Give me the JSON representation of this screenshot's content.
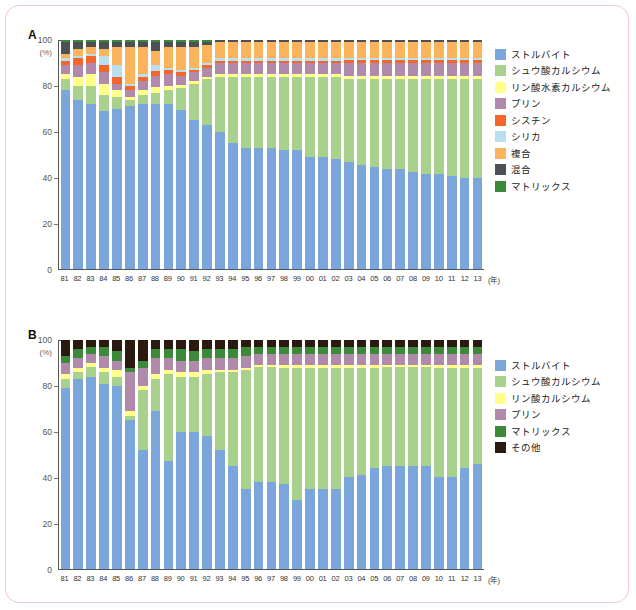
{
  "figure": {
    "border_color": "#f2c9ce",
    "background": "#ffffff"
  },
  "panels": [
    {
      "letter": "A",
      "axis": {
        "unit": "(%)",
        "yticks": [
          "100",
          "80",
          "60",
          "40",
          "20",
          "0"
        ],
        "ylim": [
          0,
          100
        ],
        "xunit": "(年)"
      }
    },
    {
      "letter": "B",
      "axis": {
        "unit": "(%)",
        "yticks": [
          "100",
          "80",
          "60",
          "40",
          "20",
          "0"
        ],
        "ylim": [
          0,
          100
        ],
        "xunit": "(年)"
      }
    }
  ],
  "chart_data": [
    {
      "panel": "A",
      "type": "bar",
      "stacked": true,
      "normalized_percent": true,
      "title": "",
      "xlabel": "(年)",
      "ylabel": "(%)",
      "ylim": [
        0,
        100
      ],
      "yticks": [
        0,
        20,
        40,
        60,
        80,
        100
      ],
      "grid": false,
      "legend_position": "right",
      "categories": [
        "81",
        "82",
        "83",
        "84",
        "85",
        "86",
        "87",
        "88",
        "89",
        "90",
        "91",
        "92",
        "93",
        "94",
        "95",
        "96",
        "97",
        "98",
        "99",
        "00",
        "01",
        "02",
        "03",
        "04",
        "05",
        "06",
        "07",
        "08",
        "09",
        "10",
        "11",
        "12",
        "13"
      ],
      "series": [
        {
          "name": "ストルバイト",
          "color": "#7aa6dc",
          "values": [
            78,
            74,
            72,
            69,
            70,
            71,
            72,
            74,
            72,
            70,
            65,
            63,
            60,
            55,
            53,
            53,
            53,
            52,
            52,
            49,
            49,
            48,
            47,
            46,
            45,
            44,
            44,
            43,
            42,
            42,
            41,
            40,
            40
          ]
        },
        {
          "name": "シュウ酸カルシウム",
          "color": "#a8d18d",
          "values": [
            5,
            6,
            8,
            7,
            5,
            3,
            4,
            5,
            6,
            10,
            16,
            20,
            24,
            29,
            31,
            31,
            31,
            32,
            32,
            35,
            35,
            36,
            37,
            38,
            39,
            40,
            40,
            41,
            42,
            42,
            43,
            44,
            44
          ]
        },
        {
          "name": "リン酸水素カルシウム",
          "color": "#ffff8a",
          "values": [
            2,
            4,
            5,
            5,
            3,
            1,
            2,
            3,
            2,
            1,
            1,
            1,
            1,
            1,
            1,
            1,
            1,
            1,
            1,
            1,
            1,
            1,
            1,
            1,
            1,
            1,
            1,
            1,
            1,
            1,
            1,
            1,
            1
          ]
        },
        {
          "name": "プリン",
          "color": "#b089ab",
          "values": [
            4,
            5,
            5,
            5,
            3,
            3,
            4,
            5,
            5,
            4,
            4,
            4,
            5,
            5,
            5,
            5,
            5,
            5,
            5,
            5,
            5,
            5,
            6,
            6,
            6,
            6,
            6,
            6,
            6,
            6,
            6,
            6,
            6
          ]
        },
        {
          "name": "シスチン",
          "color": "#f4662a",
          "values": [
            2,
            3,
            3,
            3,
            3,
            2,
            2,
            2,
            2,
            2,
            1,
            1,
            1,
            1,
            1,
            1,
            1,
            1,
            1,
            1,
            1,
            1,
            1,
            1,
            1,
            1,
            1,
            1,
            1,
            1,
            1,
            1,
            1
          ]
        },
        {
          "name": "シリカ",
          "color": "#b8dff0",
          "values": [
            1,
            1,
            1,
            4,
            5,
            1,
            1,
            3,
            1,
            1,
            1,
            1,
            1,
            1,
            1,
            1,
            1,
            1,
            1,
            1,
            1,
            1,
            1,
            1,
            1,
            1,
            1,
            1,
            1,
            1,
            1,
            1,
            1
          ]
        },
        {
          "name": "複合",
          "color": "#fbb45c",
          "values": [
            2,
            3,
            3,
            3,
            8,
            16,
            12,
            6,
            9,
            10,
            9,
            8,
            7,
            7,
            7,
            7,
            7,
            7,
            7,
            7,
            7,
            7,
            7,
            7,
            7,
            7,
            7,
            7,
            7,
            7,
            7,
            7,
            7
          ]
        },
        {
          "name": "混合",
          "color": "#4d5156",
          "values": [
            5,
            3,
            2,
            3,
            2,
            2,
            2,
            4,
            2,
            2,
            2,
            1,
            1,
            1,
            1,
            1,
            1,
            1,
            1,
            1,
            1,
            1,
            1,
            1,
            1,
            1,
            1,
            1,
            1,
            1,
            1,
            1,
            1
          ]
        },
        {
          "name": "マトリックス",
          "color": "#3a8a3a",
          "values": [
            1,
            1,
            1,
            1,
            1,
            1,
            1,
            1,
            1,
            1,
            1,
            1,
            0,
            0,
            0,
            0,
            0,
            0,
            0,
            0,
            0,
            0,
            0,
            0,
            0,
            0,
            0,
            0,
            0,
            0,
            0,
            0,
            0
          ]
        }
      ]
    },
    {
      "panel": "B",
      "type": "bar",
      "stacked": true,
      "normalized_percent": true,
      "title": "",
      "xlabel": "(年)",
      "ylabel": "(%)",
      "ylim": [
        0,
        100
      ],
      "yticks": [
        0,
        20,
        40,
        60,
        80,
        100
      ],
      "grid": false,
      "legend_position": "right",
      "categories": [
        "81",
        "82",
        "83",
        "84",
        "85",
        "86",
        "87",
        "88",
        "89",
        "90",
        "91",
        "92",
        "93",
        "94",
        "95",
        "96",
        "97",
        "98",
        "99",
        "00",
        "01",
        "02",
        "03",
        "04",
        "05",
        "06",
        "07",
        "08",
        "09",
        "10",
        "11",
        "12",
        "13"
      ],
      "series": [
        {
          "name": "ストルバイト",
          "color": "#7aa6dc",
          "values": [
            79,
            83,
            84,
            81,
            80,
            65,
            52,
            69,
            47,
            60,
            60,
            58,
            52,
            45,
            35,
            38,
            38,
            37,
            30,
            35,
            35,
            35,
            40,
            41,
            44,
            45,
            45,
            45,
            45,
            40,
            40,
            44,
            46
          ]
        },
        {
          "name": "シュウ酸カルシウム",
          "color": "#a8d18d",
          "values": [
            4,
            3,
            4,
            5,
            4,
            2,
            26,
            14,
            38,
            24,
            24,
            27,
            34,
            41,
            52,
            50,
            50,
            51,
            58,
            53,
            53,
            53,
            48,
            47,
            44,
            43,
            43,
            43,
            43,
            48,
            48,
            44,
            42
          ]
        },
        {
          "name": "リン酸カルシウム",
          "color": "#ffff8a",
          "values": [
            2,
            2,
            2,
            2,
            3,
            2,
            2,
            2,
            2,
            2,
            2,
            2,
            1,
            1,
            1,
            1,
            1,
            1,
            1,
            1,
            1,
            1,
            1,
            1,
            1,
            1,
            1,
            1,
            1,
            1,
            1,
            1,
            1
          ]
        },
        {
          "name": "プリン",
          "color": "#b089ab",
          "values": [
            5,
            4,
            4,
            5,
            4,
            17,
            8,
            7,
            5,
            5,
            5,
            5,
            5,
            5,
            5,
            5,
            5,
            5,
            5,
            5,
            5,
            5,
            5,
            5,
            5,
            5,
            5,
            5,
            5,
            5,
            5,
            5,
            5
          ]
        },
        {
          "name": "マトリックス",
          "color": "#3a8a3a",
          "values": [
            3,
            4,
            3,
            4,
            4,
            2,
            3,
            4,
            4,
            5,
            4,
            4,
            4,
            4,
            4,
            3,
            3,
            3,
            3,
            3,
            3,
            3,
            3,
            3,
            3,
            3,
            3,
            3,
            3,
            3,
            3,
            3,
            3
          ]
        },
        {
          "name": "その他",
          "color": "#2b1a10",
          "values": [
            7,
            4,
            3,
            3,
            5,
            12,
            9,
            4,
            4,
            4,
            5,
            4,
            4,
            4,
            3,
            3,
            3,
            3,
            3,
            3,
            3,
            3,
            3,
            3,
            3,
            3,
            3,
            3,
            3,
            3,
            3,
            3,
            3
          ]
        }
      ]
    }
  ],
  "legends": [
    {
      "panel": "A",
      "items": [
        {
          "label": "ストルバイト",
          "color": "#7aa6dc"
        },
        {
          "label": "シュウ酸カルシウム",
          "color": "#a8d18d"
        },
        {
          "label": "リン酸水素カルシウム",
          "color": "#ffff8a"
        },
        {
          "label": "プリン",
          "color": "#b089ab"
        },
        {
          "label": "シスチン",
          "color": "#f4662a"
        },
        {
          "label": "シリカ",
          "color": "#b8dff0"
        },
        {
          "label": "複合",
          "color": "#fbb45c"
        },
        {
          "label": "混合",
          "color": "#4d5156"
        },
        {
          "label": "マトリックス",
          "color": "#3a8a3a"
        }
      ]
    },
    {
      "panel": "B",
      "items": [
        {
          "label": "ストルバイト",
          "color": "#7aa6dc"
        },
        {
          "label": "シュウ酸カルシウム",
          "color": "#a8d18d"
        },
        {
          "label": "リン酸カルシウム",
          "color": "#ffff8a"
        },
        {
          "label": "プリン",
          "color": "#b089ab"
        },
        {
          "label": "マトリックス",
          "color": "#3a8a3a"
        },
        {
          "label": "その他",
          "color": "#2b1a10"
        }
      ]
    }
  ]
}
